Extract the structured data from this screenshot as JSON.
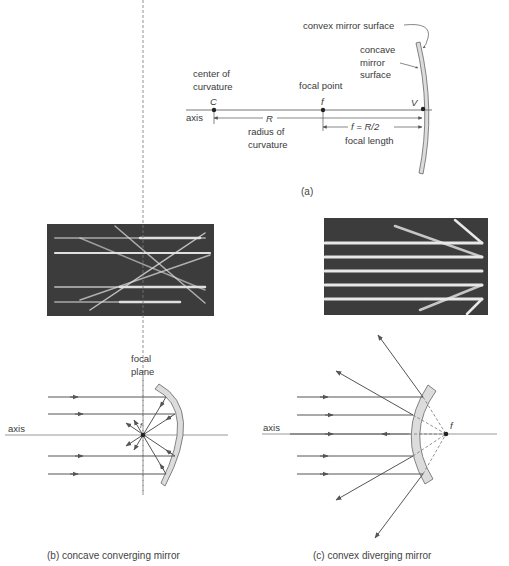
{
  "panel_a": {
    "convex_label": "convex mirror surface",
    "concave_label_1": "concave",
    "concave_label_2": "mirror",
    "concave_label_3": "surface",
    "center_label_1": "center of",
    "center_label_2": "curvature",
    "focal_point_label": "focal point",
    "C": "C",
    "f": "f",
    "V": "V",
    "axis": "axis",
    "R": "R",
    "radius_label_1": "radius of",
    "radius_label_2": "curvature",
    "f_eq": "f = R/2",
    "focal_length_label": "focal length",
    "caption": "(a)"
  },
  "panel_b": {
    "focal_plane_1": "focal",
    "focal_plane_2": "plane",
    "axis": "axis",
    "f": "f",
    "caption": "(b)  concave converging mirror"
  },
  "panel_c": {
    "axis": "axis",
    "f": "f",
    "caption": "(c)  convex diverging mirror"
  },
  "colors": {
    "mirror_fill": "#dcdcdc",
    "photo_bg": "#3c3c3c",
    "ray": "#555555"
  }
}
